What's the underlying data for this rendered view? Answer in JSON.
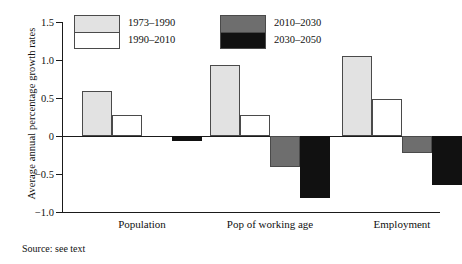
{
  "chart_data": {
    "type": "bar",
    "title": "",
    "xlabel": "",
    "ylabel": "Average annual percentage growth rates",
    "ylim": [
      -1.0,
      1.5
    ],
    "yticks": [
      1.5,
      1.0,
      0.5,
      0,
      -0.5,
      -1.0
    ],
    "ytick_labels": [
      "1.5",
      "1.0",
      "0.5",
      "0",
      "−0.5",
      "−1.0"
    ],
    "grid": false,
    "legend_position": "top-left-inside",
    "categories": [
      "Population",
      "Pop of working age",
      "Employment"
    ],
    "series": [
      {
        "name": "1973–1990",
        "color": "#e2e2e2",
        "values": [
          0.59,
          0.94,
          1.05
        ]
      },
      {
        "name": "1990–2010",
        "color": "#ffffff",
        "values": [
          0.28,
          0.27,
          0.49
        ]
      },
      {
        "name": "2010–2030",
        "color": "#6e6e6e",
        "values": [
          0.0,
          -0.41,
          -0.22
        ]
      },
      {
        "name": "2030–2050",
        "color": "#111111",
        "values": [
          -0.06,
          -0.81,
          -0.64
        ]
      }
    ],
    "annotations": [
      "Source: see text"
    ]
  },
  "legend": {
    "groups": [
      {
        "entries": [
          {
            "label": "1973–1990",
            "color": "#e2e2e2"
          },
          {
            "label": "1990–2010",
            "color": "#ffffff"
          }
        ]
      },
      {
        "entries": [
          {
            "label": "2010–2030",
            "color": "#6e6e6e"
          },
          {
            "label": "2030–2050",
            "color": "#111111"
          }
        ]
      }
    ]
  },
  "source_note": "Source: see text"
}
